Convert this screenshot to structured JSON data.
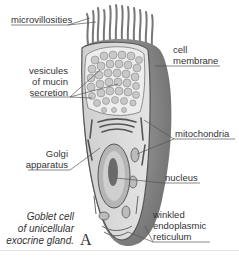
{
  "figure": {
    "caption_lines": [
      "Goblet cell",
      "of unicellular",
      "exocrine gland."
    ],
    "plate_letter": "A",
    "colors": {
      "membrane_shadow": "#8a8a8a",
      "cytoplasm": "#d9d9d9",
      "vesicle_region": "#e6e6e6",
      "vesicle": "#bdbdbd",
      "nucleus_outer": "#a8a8a8",
      "nucleus_inner": "#6a6a6a",
      "leader_line": "#555555"
    }
  },
  "labels": {
    "microvillosities": "microvillosities",
    "cell_membrane": [
      "cell",
      "membrane"
    ],
    "vesicules": [
      "vesicules",
      "of mucin",
      "secretion"
    ],
    "mitochondria": "mitochondria",
    "golgi": [
      "Golgi",
      "apparatus"
    ],
    "nucleus": "nucleus",
    "er": [
      "winkled",
      "endoplasmic",
      "reticulum"
    ]
  }
}
